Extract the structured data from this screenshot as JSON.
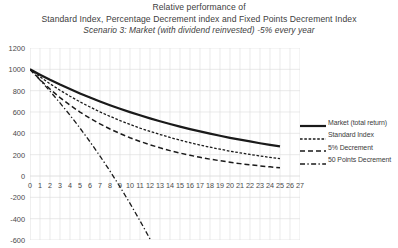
{
  "chart_data": {
    "type": "line",
    "title": "Relative performance of",
    "title_line2": "Standard Index, Percentage Decrement index and Fixed Points Decrement Index",
    "subtitle": "Scenario 3: Market (with dividend reinvested) -5% every year",
    "xlabel": "",
    "ylabel": "",
    "xlim": [
      0,
      27
    ],
    "ylim": [
      -600,
      1200
    ],
    "grid": true,
    "legend_position": "right",
    "x": [
      0,
      1,
      2,
      3,
      4,
      5,
      6,
      7,
      8,
      9,
      10,
      11,
      12,
      13,
      14,
      15,
      16,
      17,
      18,
      19,
      20,
      21,
      22,
      23,
      24,
      25
    ],
    "xticks": [
      0,
      1,
      2,
      3,
      4,
      5,
      6,
      7,
      8,
      9,
      10,
      11,
      12,
      13,
      14,
      15,
      16,
      17,
      18,
      19,
      20,
      21,
      22,
      23,
      24,
      25,
      26,
      27
    ],
    "yticks": [
      1200,
      1000,
      800,
      600,
      400,
      200,
      0,
      -200,
      -400,
      -600
    ],
    "series": [
      {
        "name": "Market (total return)",
        "style": "solid",
        "color": "#1a1a1a",
        "width": 2.2,
        "values": [
          1000,
          950,
          902,
          857,
          815,
          774,
          735,
          698,
          663,
          630,
          599,
          569,
          540,
          513,
          488,
          463,
          440,
          418,
          397,
          377,
          358,
          341,
          324,
          307,
          292,
          277
        ]
      },
      {
        "name": "Standard Index",
        "style": "dotted",
        "color": "#1a1a1a",
        "width": 1.3,
        "values": [
          1000,
          930,
          865,
          804,
          748,
          695,
          647,
          601,
          559,
          520,
          483,
          449,
          418,
          389,
          361,
          336,
          312,
          290,
          270,
          251,
          233,
          217,
          202,
          188,
          174,
          162
        ]
      },
      {
        "name": "5% Decrement",
        "style": "dashed",
        "color": "#1a1a1a",
        "width": 1.5,
        "values": [
          1000,
          903,
          815,
          735,
          664,
          599,
          541,
          488,
          441,
          398,
          359,
          324,
          293,
          264,
          238,
          215,
          194,
          175,
          158,
          143,
          129,
          116,
          105,
          95,
          86,
          77
        ]
      },
      {
        "name": "50 Points Decrement",
        "style": "dashdot",
        "color": "#1a1a1a",
        "width": 1.3,
        "values": [
          1000,
          900,
          795,
          685,
          570,
          449,
          321,
          187,
          46,
          -102,
          -257,
          -420,
          -591,
          -770,
          -958,
          -1155,
          -1362,
          -1578,
          -1805,
          -2043,
          -2292,
          -2554,
          -2828,
          -3115,
          -3417,
          -3733
        ]
      }
    ]
  },
  "axis": {
    "yticks": [
      "1200",
      "1000",
      "800",
      "600",
      "400",
      "200",
      "0",
      "-200",
      "-400",
      "-600"
    ],
    "xticks": [
      "0",
      "1",
      "2",
      "3",
      "4",
      "5",
      "6",
      "7",
      "8",
      "9",
      "10",
      "11",
      "12",
      "13",
      "14",
      "15",
      "16",
      "17",
      "18",
      "19",
      "20",
      "21",
      "22",
      "23",
      "24",
      "25",
      "26",
      "27"
    ]
  },
  "legend": {
    "items": [
      {
        "label": "Market (total return)",
        "style": "solid"
      },
      {
        "label": "Standard Index",
        "style": "dotted"
      },
      {
        "label": "5% Decrement",
        "style": "dashed"
      },
      {
        "label": "50 Points Decrement",
        "style": "dashdot"
      }
    ]
  }
}
